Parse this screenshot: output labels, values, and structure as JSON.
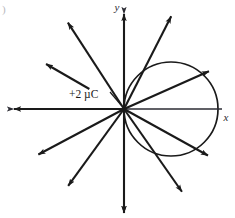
{
  "figure": {
    "panel_label": ")",
    "background_color": "#ffffff",
    "stroke_color": "#1a1a1a",
    "axis_color": "#2b2b33",
    "width": 235,
    "height": 218
  },
  "axes": {
    "x_label": "x",
    "y_label": "y",
    "origin": {
      "x": 124,
      "y": 109
    },
    "x_axis": {
      "x1": 14,
      "y1": 109,
      "x2": 222,
      "y2": 109,
      "arrow_start": true,
      "arrow_end": false
    },
    "y_axis": {
      "x1": 124,
      "y1": 14,
      "x2": 124,
      "y2": 213,
      "arrow_start": true,
      "arrow_end": true
    },
    "x_label_pos": {
      "x": 226,
      "y": 121
    },
    "y_label_pos": {
      "x": 117,
      "y": 11
    }
  },
  "charge": {
    "label": "+2 µC",
    "value": "+2",
    "unit": "µC",
    "label_pos": {
      "x": 69,
      "y": 94
    },
    "leader": {
      "x1": 110,
      "y1": 92,
      "x2": 121,
      "y2": 105
    }
  },
  "circle": {
    "name": "gaussian-surface",
    "center": {
      "x": 171,
      "y": 109
    },
    "radius": 47,
    "passes_through_origin": true
  },
  "chart_data": {
    "type": "scatter",
    "xlabel": "x",
    "ylabel": "y",
    "legend": [],
    "grid": false,
    "annotations": [
      "+2 µC"
    ],
    "field_lines": [
      {
        "id": "line-up",
        "angle_deg": 90,
        "length": 95,
        "detached": false,
        "arrow": "end"
      },
      {
        "id": "line-down",
        "angle_deg": 270,
        "length": 104,
        "detached": false,
        "arrow": "end"
      },
      {
        "id": "line-left",
        "angle_deg": 180,
        "length": 110,
        "detached": false,
        "arrow": "end"
      },
      {
        "id": "line-ur-steep",
        "angle_deg": 63,
        "length": 104,
        "detached": false,
        "arrow": "end"
      },
      {
        "id": "line-ur-shallow",
        "angle_deg": 24,
        "length": 93,
        "detached": false,
        "arrow": "end"
      },
      {
        "id": "line-ul-steep",
        "angle_deg": 123,
        "length": 103,
        "detached": false,
        "arrow": "end"
      },
      {
        "id": "line-ul-shallow",
        "angle_deg": 150,
        "length": 90,
        "detached": true,
        "arrow": "end",
        "gap": 40
      },
      {
        "id": "line-ll-shallow",
        "angle_deg": 208,
        "length": 97,
        "detached": false,
        "arrow": "end"
      },
      {
        "id": "line-ll-steep",
        "angle_deg": 234,
        "length": 95,
        "detached": false,
        "arrow": "end"
      },
      {
        "id": "line-lr-shallow",
        "angle_deg": 331,
        "length": 96,
        "detached": false,
        "arrow": "end"
      },
      {
        "id": "line-lr-steep",
        "angle_deg": 305,
        "length": 101,
        "detached": false,
        "arrow": "end"
      }
    ]
  }
}
